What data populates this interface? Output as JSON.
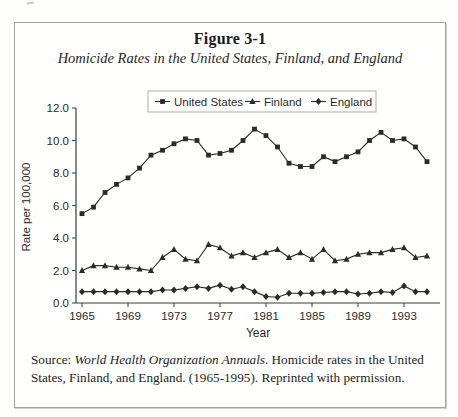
{
  "figure": {
    "title": "Figure 3-1",
    "subtitle": "Homicide Rates in the United States, Finland, and England"
  },
  "chart_data": {
    "type": "line",
    "title": "",
    "xlabel": "Year",
    "ylabel": "Rate per 100,000",
    "xlim": [
      1965,
      1995
    ],
    "ylim": [
      0,
      12
    ],
    "grid": false,
    "legend_position": "top-center",
    "x_ticks": [
      1965,
      1969,
      1973,
      1977,
      1981,
      1985,
      1989,
      1993
    ],
    "y_ticks": [
      "0.0",
      "2.0",
      "4.0",
      "6.0",
      "8.0",
      "10.0",
      "12.0"
    ],
    "x": [
      1965,
      1966,
      1967,
      1968,
      1969,
      1970,
      1971,
      1972,
      1973,
      1974,
      1975,
      1976,
      1977,
      1978,
      1979,
      1980,
      1981,
      1982,
      1983,
      1984,
      1985,
      1986,
      1987,
      1988,
      1989,
      1990,
      1991,
      1992,
      1993,
      1994,
      1995
    ],
    "series": [
      {
        "name": "United States",
        "marker": "square",
        "values": [
          5.5,
          5.9,
          6.8,
          7.3,
          7.7,
          8.3,
          9.1,
          9.4,
          9.8,
          10.1,
          10.0,
          9.1,
          9.2,
          9.4,
          10.0,
          10.7,
          10.3,
          9.6,
          8.6,
          8.4,
          8.4,
          9.0,
          8.7,
          9.0,
          9.3,
          10.0,
          10.5,
          10.0,
          10.1,
          9.6,
          8.7
        ]
      },
      {
        "name": "Finland",
        "marker": "triangle",
        "values": [
          2.0,
          2.3,
          2.3,
          2.2,
          2.2,
          2.1,
          2.0,
          2.8,
          3.3,
          2.7,
          2.6,
          3.6,
          3.4,
          2.9,
          3.1,
          2.8,
          3.1,
          3.3,
          2.8,
          3.1,
          2.7,
          3.3,
          2.6,
          2.7,
          3.0,
          3.1,
          3.1,
          3.3,
          3.4,
          2.8,
          2.9
        ]
      },
      {
        "name": "England",
        "marker": "diamond",
        "values": [
          0.7,
          0.7,
          0.7,
          0.7,
          0.7,
          0.7,
          0.7,
          0.8,
          0.8,
          0.9,
          1.0,
          0.9,
          1.1,
          0.85,
          1.0,
          0.7,
          0.4,
          0.35,
          0.6,
          0.6,
          0.6,
          0.65,
          0.7,
          0.7,
          0.55,
          0.6,
          0.7,
          0.65,
          1.05,
          0.7,
          0.7
        ]
      }
    ]
  },
  "source": {
    "prefix": "Source: ",
    "italic": "World Health Organization Annuals",
    "rest": ". Homicide rates in the United States, Finland, and England. (1965-1995). Reprinted with permission."
  },
  "colors": {
    "ink": "#2a2a2a",
    "axis": "#3a3a3a",
    "legend_border": "#ababab",
    "box_border": "#a3a3a3"
  }
}
